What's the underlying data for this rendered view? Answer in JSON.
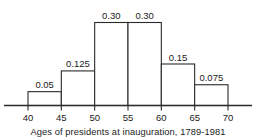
{
  "chart_data": {
    "type": "bar",
    "title": "",
    "subtitle": "",
    "xlabel": "Ages of presidents at inauguration, 1789-1981",
    "ylabel": "",
    "grid": false,
    "legend": null,
    "xlim": [
      40,
      70
    ],
    "ylim": [
      0,
      0.3
    ],
    "bin_width": 5,
    "categories": [
      "40-45",
      "45-50",
      "50-55",
      "55-60",
      "60-65",
      "65-70"
    ],
    "values": [
      0.05,
      0.125,
      0.3,
      0.3,
      0.15,
      0.075
    ],
    "bars": [
      {
        "x0": 40,
        "x1": 45,
        "value": 0.05,
        "label": "0.05"
      },
      {
        "x0": 45,
        "x1": 50,
        "value": 0.125,
        "label": "0.125"
      },
      {
        "x0": 50,
        "x1": 55,
        "value": 0.3,
        "label": "0.30"
      },
      {
        "x0": 55,
        "x1": 60,
        "value": 0.3,
        "label": "0.30"
      },
      {
        "x0": 60,
        "x1": 65,
        "value": 0.15,
        "label": "0.15"
      },
      {
        "x0": 65,
        "x1": 70,
        "value": 0.075,
        "label": "0.075"
      }
    ],
    "x_ticks": [
      40,
      45,
      50,
      55,
      60,
      65,
      70
    ],
    "x_tick_labels": [
      "40",
      "45",
      "50",
      "55",
      "60",
      "65",
      "70"
    ],
    "colors": {
      "bar_fill": "#ffffff",
      "bar_stroke": "#2b2b2b",
      "axis": "#2b2b2b",
      "text": "#1a1a1a",
      "background": "#ffffff"
    }
  }
}
